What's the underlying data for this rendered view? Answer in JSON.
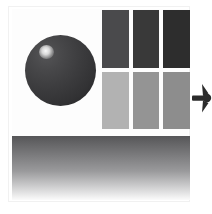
{
  "composition": {
    "title": "Abstract Grayscale Composition",
    "background_color": "#ffffff",
    "frame_border_color": "#f1f1f1"
  },
  "sphere": {
    "label": "shaded sphere",
    "base_color": "#3c3c3e",
    "shadow_color": "#202022",
    "highlight_color": "#ffffff",
    "diameter_px": 71,
    "center_x": 60,
    "center_y": 70
  },
  "grid": {
    "label": "rectangle swatch grid",
    "columns": 3,
    "rows": 2,
    "gutter_color": "#ffffff",
    "cells": [
      {
        "id": "cell-r1c1",
        "row": 1,
        "column": 1,
        "tone": "dark",
        "color": "#4a4a4c"
      },
      {
        "id": "cell-r1c2",
        "row": 1,
        "column": 2,
        "tone": "darker",
        "color": "#393939"
      },
      {
        "id": "cell-r1c3",
        "row": 1,
        "column": 3,
        "tone": "darkest",
        "color": "#2d2d2d"
      },
      {
        "id": "cell-r2c1",
        "row": 2,
        "column": 1,
        "tone": "light",
        "color": "#b2b2b2"
      },
      {
        "id": "cell-r2c2",
        "row": 2,
        "column": 2,
        "tone": "medium",
        "color": "#949494"
      },
      {
        "id": "cell-r2c3",
        "row": 2,
        "column": 3,
        "tone": "medium-dark",
        "color": "#8d8d8d"
      }
    ]
  },
  "gradient_panel": {
    "label": "vertical gradient band",
    "direction": "top-to-bottom",
    "top_color": "#565658",
    "mid_color": "#9a9a9c",
    "bottom_color": "#fbfbfb"
  },
  "edge_glyph": {
    "label": "clipped arrow mark",
    "icon": "arrow-right-icon",
    "color": "#2b2b2b"
  }
}
